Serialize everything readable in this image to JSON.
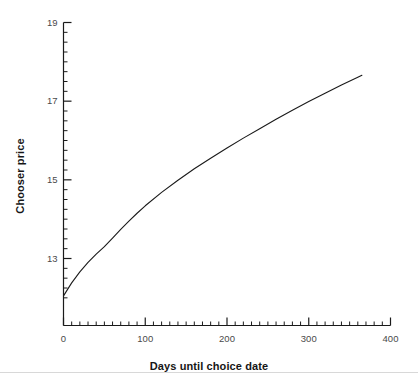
{
  "figure": {
    "background_color": "#ffffff",
    "line_color": "#1a1a1a",
    "axis_color": "#1a1a1a",
    "tick_label_color": "#4a4a4a"
  },
  "axes": {
    "x_title": "Days until choice date",
    "y_title": "Chooser price",
    "x_tick_labels": [
      "0",
      "100",
      "200",
      "300",
      "400"
    ],
    "y_tick_labels": [
      "13",
      "15",
      "17",
      "19"
    ]
  },
  "chart_data": {
    "type": "line",
    "title": "",
    "xlabel": "Days until choice date",
    "ylabel": "Chooser price",
    "xlim": [
      0,
      400
    ],
    "ylim": [
      12.0,
      19.2
    ],
    "xticks": [
      0,
      100,
      200,
      300,
      400
    ],
    "yticks": [
      13,
      15,
      17,
      19
    ],
    "x_minor_tick_step": 10,
    "y_minor_tick_step": 0.25,
    "grid": false,
    "legend": null,
    "series": [
      {
        "name": "Chooser price",
        "color": "#1a1a1a",
        "line_width": 1.1,
        "x": [
          0,
          10,
          20,
          30,
          40,
          50,
          60,
          70,
          80,
          90,
          100,
          120,
          140,
          160,
          180,
          200,
          220,
          240,
          260,
          280,
          300,
          320,
          340,
          360,
          365
        ],
        "y": [
          12.05,
          12.38,
          12.66,
          12.9,
          13.11,
          13.3,
          13.52,
          13.74,
          13.95,
          14.15,
          14.34,
          14.68,
          14.99,
          15.28,
          15.55,
          15.81,
          16.06,
          16.3,
          16.54,
          16.77,
          16.99,
          17.2,
          17.41,
          17.61,
          17.66
        ]
      }
    ]
  }
}
